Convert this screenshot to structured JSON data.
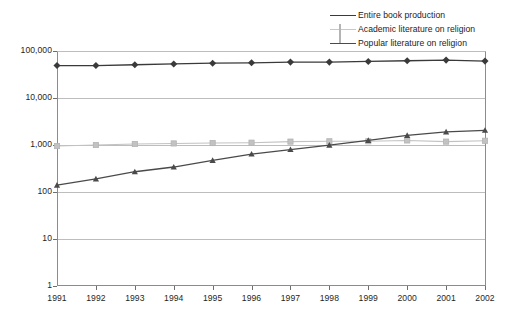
{
  "chart_data": {
    "type": "line",
    "title": "",
    "xlabel": "",
    "ylabel": "",
    "yscale": "log",
    "ylim": [
      1,
      100000
    ],
    "ytick_labels": [
      "100,000",
      "10,000",
      "1,000",
      "100",
      "10",
      "1"
    ],
    "ytick_values": [
      100000,
      10000,
      1000,
      100,
      10,
      1
    ],
    "grid": true,
    "legend_position": "top-right",
    "categories": [
      "1991",
      "1992",
      "1993",
      "1994",
      "1995",
      "1996",
      "1997",
      "1998",
      "1999",
      "2000",
      "2001",
      "2002"
    ],
    "x": [
      1991,
      1992,
      1993,
      1994,
      1995,
      1996,
      1997,
      1998,
      1999,
      2000,
      2001,
      2002
    ],
    "series": [
      {
        "name": "Entire book production",
        "color": "#3a3a3a",
        "marker": "diamond",
        "values": [
          49000,
          49000,
          51000,
          53000,
          55000,
          56000,
          58000,
          58000,
          60000,
          62000,
          64000,
          61000
        ]
      },
      {
        "name": "Academic literature on religion",
        "color": "#c2c2c2",
        "marker": "square",
        "values": [
          950,
          1000,
          1050,
          1080,
          1100,
          1120,
          1180,
          1200,
          1200,
          1250,
          1180,
          1230
        ]
      },
      {
        "name": "Popular literature on religion",
        "color": "#4a4a4a",
        "marker": "triangle",
        "values": [
          140,
          190,
          270,
          340,
          470,
          640,
          800,
          990,
          1250,
          1600,
          1900,
          2050
        ]
      }
    ]
  },
  "legend": {
    "items": [
      {
        "label": "Entire book production"
      },
      {
        "label": "Academic literature on religion"
      },
      {
        "label": "Popular literature on religion"
      }
    ]
  }
}
